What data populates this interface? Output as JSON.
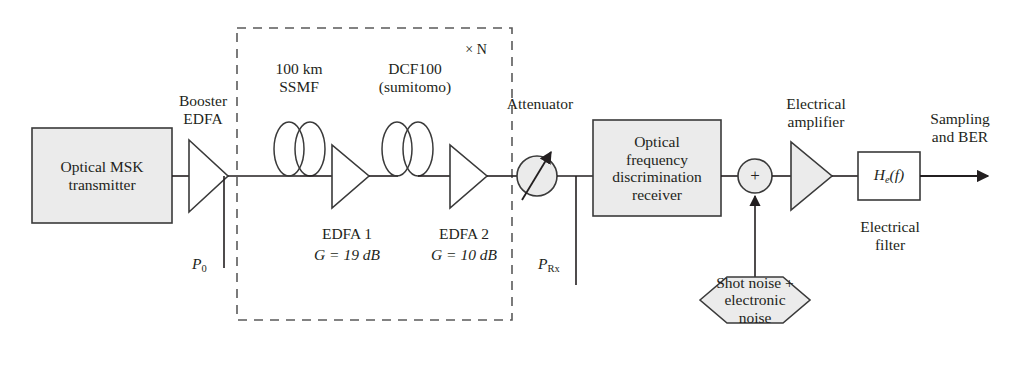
{
  "figure": {
    "type": "block-diagram",
    "domain": "optical communication system",
    "background": "#ffffff",
    "line_color": "#231f20",
    "fill_gray": "#ebebeb"
  },
  "blocks": {
    "transmitter": {
      "label": "Optical MSK\ntransmitter",
      "shape": "rectangle",
      "fill": "#ebebeb"
    },
    "receiver": {
      "label": "Optical\nfrequency\ndiscrimination\nreceiver",
      "shape": "rectangle",
      "fill": "#ebebeb"
    },
    "noise_source": {
      "label": "Shot noise +\nelectronic\nnoise",
      "shape": "hexagon",
      "fill": "#ebebeb"
    },
    "electrical_filter": {
      "label_html": "H<sub>e</sub>(f)",
      "label": "He(f)",
      "caption": "Electrical\nfilter",
      "shape": "rectangle",
      "fill": "#ffffff"
    }
  },
  "amplifiers": {
    "booster": {
      "caption": "Booster\nEDFA",
      "fill": "#ffffff"
    },
    "edfa1": {
      "caption": "EDFA 1",
      "gain": "G = 19 dB",
      "fill": "#ffffff"
    },
    "edfa2": {
      "caption": "EDFA 2",
      "gain": "G = 10 dB",
      "fill": "#ffffff"
    },
    "electrical": {
      "caption": "Electrical\namplifier",
      "fill": "#ebebeb"
    }
  },
  "fiber_spools": {
    "ssmf": {
      "label": "100 km\nSSMF",
      "icon": "fiber-spool-icon"
    },
    "dcf": {
      "label": "DCF100\n(sumitomo)",
      "icon": "fiber-spool-icon"
    }
  },
  "components": {
    "attenuator": {
      "label": "Attenuator",
      "icon": "variable-attenuator-icon",
      "fill": "#ebebeb"
    },
    "summing_junction": {
      "symbol": "+",
      "icon": "summing-junction-icon",
      "fill": "#ebebeb"
    }
  },
  "annotations": {
    "span_repeat": "× N",
    "power_tx": "P",
    "power_tx_sub": "0",
    "power_rx": "P",
    "power_rx_sub": "Rx",
    "output": "Sampling\nand BER"
  }
}
